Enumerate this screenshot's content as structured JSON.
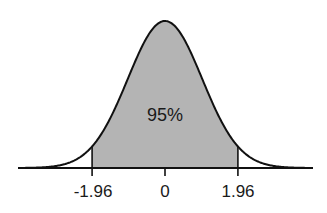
{
  "chart_data": {
    "type": "area",
    "title": "",
    "subtitle": "",
    "xlabel": "",
    "ylabel": "",
    "distribution": "standard normal",
    "mean": 0,
    "sd": 1,
    "xlim": [
      -4,
      4
    ],
    "grid": false,
    "legend": null,
    "shaded_region": {
      "from": -1.96,
      "to": 1.96,
      "label": "95%",
      "color": "#b4b4b4"
    },
    "x_ticks": [
      -1.96,
      0,
      1.96
    ],
    "tick_labels": [
      "-1.96",
      "0",
      "1.96"
    ],
    "annotations": [
      {
        "text": "95%",
        "x": 0,
        "position": "center of shaded area"
      }
    ],
    "colors": {
      "curve": "#111111",
      "fill": "#b4b4b4",
      "axis": "#111111",
      "background": "#ffffff"
    }
  }
}
